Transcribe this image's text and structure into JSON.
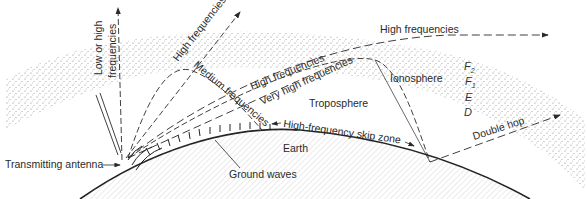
{
  "diagram": {
    "type": "radio wave propagation",
    "labels": {
      "low_or_high_line1": "Low or high",
      "low_or_high_line2": "frequencies",
      "high_freq_steep": "High frequencies",
      "high_freq_top": "High frequencies",
      "medium_frequencies": "Medium frequencies",
      "high_freq_mid": "High frequencies",
      "very_high_frequencies": "Very high frequencies",
      "troposphere": "Troposphere",
      "ionosphere": "Ionosphere",
      "skip_zone": "High-frequency skip zone",
      "earth": "Earth",
      "double_hop": "Double hop",
      "ground_waves": "Ground waves",
      "transmitting_antenna": "Transmitting antenna"
    },
    "ionosphere_layers": [
      {
        "name": "F",
        "sub": "2"
      },
      {
        "name": "F",
        "sub": "1"
      },
      {
        "name": "E",
        "sub": ""
      },
      {
        "name": "D",
        "sub": ""
      }
    ],
    "colors": {
      "ink": "#2a2a2a",
      "stipple": "#555555",
      "background": "#ffffff"
    }
  }
}
